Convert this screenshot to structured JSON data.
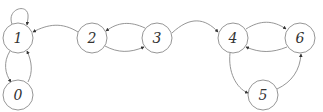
{
  "diagram": {
    "type": "directed-graph",
    "colors": {
      "stroke": "#8a8a8a",
      "label": "#333333",
      "background": "#ffffff"
    },
    "node_radius": 15,
    "nodes": [
      {
        "id": "0",
        "label": "0",
        "x": 18,
        "y": 95
      },
      {
        "id": "1",
        "label": "1",
        "x": 18,
        "y": 38
      },
      {
        "id": "2",
        "label": "2",
        "x": 92,
        "y": 38
      },
      {
        "id": "3",
        "label": "3",
        "x": 157,
        "y": 38
      },
      {
        "id": "4",
        "label": "4",
        "x": 233,
        "y": 38
      },
      {
        "id": "5",
        "label": "5",
        "x": 263,
        "y": 95
      },
      {
        "id": "6",
        "label": "6",
        "x": 300,
        "y": 38
      }
    ],
    "edges": [
      {
        "from": "1",
        "to": "1",
        "kind": "self-loop"
      },
      {
        "from": "1",
        "to": "0"
      },
      {
        "from": "0",
        "to": "1"
      },
      {
        "from": "2",
        "to": "1"
      },
      {
        "from": "3",
        "to": "2"
      },
      {
        "from": "2",
        "to": "3"
      },
      {
        "from": "3",
        "to": "4"
      },
      {
        "from": "4",
        "to": "6"
      },
      {
        "from": "6",
        "to": "4"
      },
      {
        "from": "4",
        "to": "5"
      },
      {
        "from": "5",
        "to": "6"
      }
    ]
  }
}
